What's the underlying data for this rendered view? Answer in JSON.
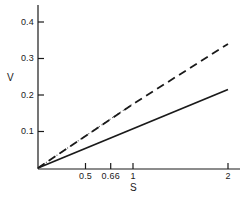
{
  "chart_data": {
    "type": "line",
    "title": "",
    "subtitle": "",
    "xlabel": "S",
    "ylabel": "V",
    "xlim": [
      0,
      2.1
    ],
    "ylim": [
      0,
      0.45
    ],
    "grid": false,
    "legend": "none",
    "xticks": [
      {
        "value": 0.5,
        "label": "0.5"
      },
      {
        "value": 0.66,
        "label": "0.66"
      },
      {
        "value": 1.0,
        "label": "1"
      },
      {
        "value": 2.0,
        "label": "2"
      }
    ],
    "yticks": [
      {
        "value": 0.1,
        "label": "0.1"
      },
      {
        "value": 0.2,
        "label": "0.2"
      },
      {
        "value": 0.3,
        "label": "0.3"
      },
      {
        "value": 0.4,
        "label": "0.4"
      }
    ],
    "series": [
      {
        "name": "solid-line",
        "style": "solid",
        "color": "#1a1a1a",
        "x": [
          0.0,
          2.0
        ],
        "values": [
          0.0,
          0.215
        ]
      },
      {
        "name": "dashed-line",
        "style": "dashed",
        "color": "#1a1a1a",
        "x": [
          0.0,
          1.0,
          2.0
        ],
        "values": [
          0.0,
          0.175,
          0.34
        ]
      },
      {
        "name": "dotted-line",
        "style": "dotted",
        "color": "#555555",
        "x": [
          0.0,
          1.0
        ],
        "values": [
          0.0,
          0.176
        ]
      }
    ],
    "annotations": []
  }
}
